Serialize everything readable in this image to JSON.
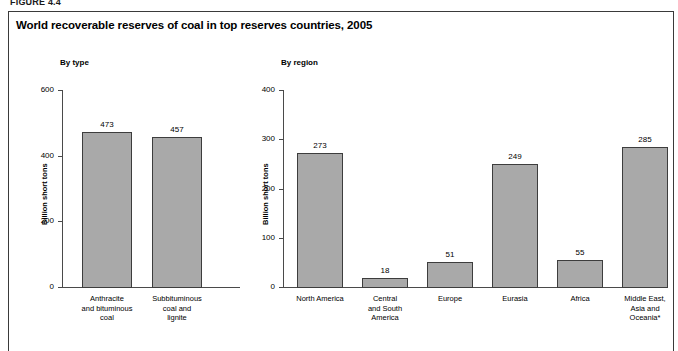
{
  "figure_label": "FIGURE 4.4",
  "title": "World recoverable reserves of coal in top reserves countries, 2005",
  "panels": {
    "left": {
      "heading": "By type",
      "ylabel": "Billion short tons"
    },
    "right": {
      "heading": "By region",
      "ylabel": "Billion short tons"
    }
  },
  "chart_data": [
    {
      "type": "bar",
      "title": "By type",
      "xlabel": "",
      "ylabel": "Billion short tons",
      "ylim": [
        0,
        600
      ],
      "yticks": [
        0,
        200,
        400,
        600
      ],
      "ytick_labels": [
        "0",
        "200",
        "400",
        "600"
      ],
      "grid": false,
      "legend": "none",
      "categories": [
        "Anthracite and bituminous coal",
        "Subbituminous coal and lignite"
      ],
      "category_lines": [
        [
          "Anthracite",
          "and bituminous",
          "coal"
        ],
        [
          "Subbituminous",
          "coal and",
          "lignite"
        ]
      ],
      "values": [
        473,
        457
      ],
      "value_labels": [
        "473",
        "457"
      ],
      "bar_color": "#a9a9a9",
      "bar_edge_color": "#3d3d3d"
    },
    {
      "type": "bar",
      "title": "By region",
      "xlabel": "",
      "ylabel": "Billion short tons",
      "ylim": [
        0,
        400
      ],
      "yticks": [
        0,
        100,
        200,
        300,
        400
      ],
      "ytick_labels": [
        "0",
        "100",
        "200",
        "300",
        "400"
      ],
      "grid": false,
      "legend": "none",
      "categories": [
        "North America",
        "Central and South America",
        "Europe",
        "Eurasia",
        "Africa",
        "Middle East, Asia and Oceania*"
      ],
      "category_lines": [
        [
          "North America"
        ],
        [
          "Central",
          "and South",
          "America"
        ],
        [
          "Europe"
        ],
        [
          "Eurasia"
        ],
        [
          "Africa"
        ],
        [
          "Middle East,",
          "Asia and",
          "Oceania*"
        ]
      ],
      "values": [
        273,
        18,
        51,
        249,
        55,
        285
      ],
      "value_labels": [
        "273",
        "18",
        "51",
        "249",
        "55",
        "285"
      ],
      "bar_color": "#a9a9a9",
      "bar_edge_color": "#3d3d3d"
    }
  ]
}
